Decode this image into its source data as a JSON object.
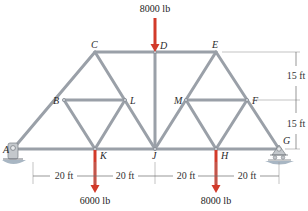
{
  "diagram": {
    "type": "truss",
    "nodes": {
      "A": {
        "label": "A",
        "x": 13,
        "y": 149
      },
      "B": {
        "label": "B",
        "x": 64,
        "y": 100
      },
      "C": {
        "label": "C",
        "x": 95,
        "y": 52
      },
      "D": {
        "label": "D",
        "x": 155,
        "y": 52
      },
      "E": {
        "label": "E",
        "x": 216,
        "y": 52
      },
      "F": {
        "label": "F",
        "x": 247,
        "y": 100
      },
      "G": {
        "label": "G",
        "x": 279,
        "y": 149
      },
      "H": {
        "label": "H",
        "x": 216,
        "y": 149
      },
      "J": {
        "label": "J",
        "x": 155,
        "y": 149
      },
      "K": {
        "label": "K",
        "x": 95,
        "y": 149
      },
      "L": {
        "label": "L",
        "x": 125,
        "y": 100
      },
      "M": {
        "label": "M",
        "x": 186,
        "y": 100
      }
    },
    "loads": [
      {
        "label": "8000 lb",
        "node": "D",
        "direction": "down",
        "position": "top"
      },
      {
        "label": "6000 lb",
        "node": "K",
        "direction": "down",
        "position": "bottom"
      },
      {
        "label": "8000 lb",
        "node": "H",
        "direction": "down",
        "position": "bottom"
      }
    ],
    "dimensions": {
      "horizontal": [
        "20 ft",
        "20 ft",
        "20 ft",
        "20 ft"
      ],
      "vertical": [
        "15 ft",
        "15 ft"
      ]
    },
    "supports": {
      "A": "pin",
      "G": "roller"
    },
    "colors": {
      "member": "#9aa0a8",
      "load_arrow": "#d23a2a",
      "ground": "#8ea2b4"
    }
  }
}
